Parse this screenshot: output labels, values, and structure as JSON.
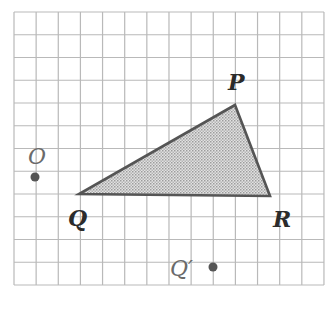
{
  "diagram": {
    "grid": {
      "x0": 14,
      "y0": 12,
      "cols": 14,
      "rows": 12,
      "cell_w": 22.14,
      "cell_h": 22.75,
      "line_color": "#b9b9b9"
    },
    "triangle": {
      "fill_color": "#c9c9c9",
      "stroke_color": "#555555",
      "vertices": [
        {
          "name": "P",
          "x": 235,
          "y": 105
        },
        {
          "name": "Q",
          "x": 79,
          "y": 194
        },
        {
          "name": "R",
          "x": 270,
          "y": 196
        }
      ]
    },
    "points": [
      {
        "name": "O",
        "x": 35,
        "y": 177
      },
      {
        "name": "Q_prime",
        "x": 213,
        "y": 267
      }
    ],
    "labels": {
      "P": {
        "text": "P",
        "x": 228,
        "y": 90
      },
      "Q": {
        "text": "Q",
        "x": 68,
        "y": 226
      },
      "R": {
        "text": "R",
        "x": 273,
        "y": 227
      },
      "O": {
        "text": "O",
        "x": 28,
        "y": 164
      },
      "Q_prime": {
        "text": "Q′",
        "x": 170,
        "y": 276
      }
    }
  }
}
